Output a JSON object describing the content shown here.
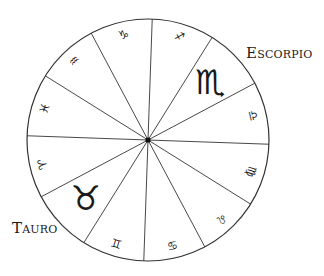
{
  "diagram": {
    "center": [
      148,
      140
    ],
    "radius": 121,
    "start_angle_deg": -88,
    "stroke_color": "#333333",
    "segments": [
      {
        "sign": "Sagittarius",
        "glyph": "♐",
        "size": 11,
        "highlight": false
      },
      {
        "sign": "Scorpio",
        "glyph": "♏",
        "size": 34,
        "highlight": true
      },
      {
        "sign": "Libra",
        "glyph": "♎",
        "size": 12,
        "highlight": false
      },
      {
        "sign": "Virgo",
        "glyph": "♍",
        "size": 12,
        "highlight": false
      },
      {
        "sign": "Leo",
        "glyph": "♌",
        "size": 12,
        "highlight": false
      },
      {
        "sign": "Cancer",
        "glyph": "♋",
        "size": 12,
        "highlight": false
      },
      {
        "sign": "Gemini",
        "glyph": "♊",
        "size": 12,
        "highlight": false
      },
      {
        "sign": "Taurus",
        "glyph": "♉",
        "size": 34,
        "highlight": true
      },
      {
        "sign": "Aries",
        "glyph": "♈",
        "size": 12,
        "highlight": false
      },
      {
        "sign": "Pisces",
        "glyph": "♓",
        "size": 12,
        "highlight": false
      },
      {
        "sign": "Aquarius",
        "glyph": "♒",
        "size": 12,
        "highlight": false
      },
      {
        "sign": "Capricorn",
        "glyph": "♑",
        "size": 12,
        "highlight": false
      }
    ]
  },
  "labels": {
    "escorpio": "Escorpio",
    "tauro": "Tauro"
  }
}
